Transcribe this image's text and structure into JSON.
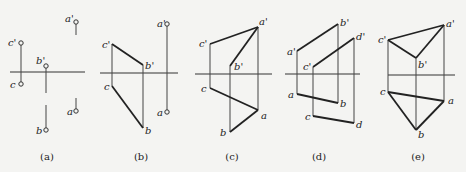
{
  "figure": {
    "panels": [
      {
        "id": "a",
        "caption": "(a)",
        "axis": {
          "x1": 10,
          "x2": 85,
          "y": 72
        },
        "points": [
          {
            "name": "a'",
            "x": 76,
            "y": 22,
            "lx": 65,
            "ly": 22
          },
          {
            "name": "c'",
            "x": 21,
            "y": 43,
            "lx": 8,
            "ly": 46
          },
          {
            "name": "b'",
            "x": 46,
            "y": 66,
            "lx": 36,
            "ly": 64
          },
          {
            "name": "c",
            "x": 21,
            "y": 84,
            "lx": 10,
            "ly": 88
          },
          {
            "name": "a",
            "x": 76,
            "y": 111,
            "lx": 67,
            "ly": 115
          },
          {
            "name": "b",
            "x": 46,
            "y": 130,
            "lx": 36,
            "ly": 134
          }
        ],
        "thin_lines": [
          [
            76,
            22,
            76,
            35
          ],
          [
            21,
            43,
            21,
            84
          ],
          [
            46,
            66,
            46,
            93
          ],
          [
            46,
            105,
            46,
            130
          ],
          [
            76,
            98,
            76,
            111
          ]
        ],
        "thick_lines": [],
        "circles": [
          "a'",
          "c'",
          "b'",
          "c",
          "a",
          "b"
        ]
      },
      {
        "id": "b",
        "caption": "(b)",
        "axis": {
          "x1": 100,
          "x2": 178,
          "y": 73
        },
        "points": [
          {
            "name": "a'",
            "x": 167,
            "y": 24,
            "lx": 157,
            "ly": 27
          },
          {
            "name": "c'",
            "x": 112,
            "y": 44,
            "lx": 102,
            "ly": 48
          },
          {
            "name": "b'",
            "x": 143,
            "y": 65,
            "lx": 145,
            "ly": 69
          },
          {
            "name": "c",
            "x": 112,
            "y": 86,
            "lx": 104,
            "ly": 90
          },
          {
            "name": "a",
            "x": 167,
            "y": 112,
            "lx": 157,
            "ly": 116
          },
          {
            "name": "b",
            "x": 143,
            "y": 128,
            "lx": 145,
            "ly": 134
          }
        ],
        "thin_lines": [
          [
            112,
            44,
            112,
            86
          ],
          [
            143,
            65,
            143,
            128
          ],
          [
            167,
            24,
            167,
            112
          ]
        ],
        "thick_lines": [
          [
            112,
            44,
            143,
            65
          ],
          [
            112,
            86,
            143,
            128
          ]
        ],
        "circles": [
          "a'",
          "a"
        ]
      },
      {
        "id": "c",
        "caption": "(c)",
        "axis": {
          "x1": 195,
          "x2": 272,
          "y": 74
        },
        "points": [
          {
            "name": "a'",
            "x": 258,
            "y": 27,
            "lx": 259,
            "ly": 25
          },
          {
            "name": "c'",
            "x": 210,
            "y": 44,
            "lx": 199,
            "ly": 47
          },
          {
            "name": "b'",
            "x": 230,
            "y": 66,
            "lx": 234,
            "ly": 70
          },
          {
            "name": "c",
            "x": 210,
            "y": 88,
            "lx": 201,
            "ly": 92
          },
          {
            "name": "a",
            "x": 258,
            "y": 110,
            "lx": 261,
            "ly": 119
          },
          {
            "name": "b",
            "x": 230,
            "y": 132,
            "lx": 220,
            "ly": 136
          }
        ],
        "thin_lines": [
          [
            210,
            44,
            210,
            88
          ],
          [
            230,
            66,
            230,
            132
          ],
          [
            258,
            27,
            258,
            110
          ]
        ],
        "thick_lines": [
          [
            210,
            44,
            258,
            27
          ],
          [
            230,
            66,
            258,
            27
          ],
          [
            210,
            88,
            258,
            110
          ],
          [
            230,
            132,
            258,
            110
          ]
        ],
        "circles": []
      },
      {
        "id": "d",
        "caption": "(d)",
        "axis": {
          "x1": 285,
          "x2": 360,
          "y": 74
        },
        "points": [
          {
            "name": "a'",
            "x": 297,
            "y": 51,
            "lx": 287,
            "ly": 55
          },
          {
            "name": "b'",
            "x": 338,
            "y": 24,
            "lx": 340,
            "ly": 26
          },
          {
            "name": "d'",
            "x": 354,
            "y": 38,
            "lx": 356,
            "ly": 40
          },
          {
            "name": "c'",
            "x": 313,
            "y": 67,
            "lx": 303,
            "ly": 70
          },
          {
            "name": "a",
            "x": 297,
            "y": 94,
            "lx": 288,
            "ly": 98
          },
          {
            "name": "b",
            "x": 338,
            "y": 103,
            "lx": 340,
            "ly": 107
          },
          {
            "name": "c",
            "x": 313,
            "y": 116,
            "lx": 305,
            "ly": 120
          },
          {
            "name": "d",
            "x": 354,
            "y": 123,
            "lx": 356,
            "ly": 128
          }
        ],
        "thin_lines": [
          [
            297,
            51,
            297,
            94
          ],
          [
            338,
            24,
            338,
            103
          ],
          [
            313,
            67,
            313,
            116
          ],
          [
            354,
            38,
            354,
            123
          ]
        ],
        "thick_lines": [
          [
            297,
            51,
            338,
            24
          ],
          [
            313,
            67,
            354,
            38
          ],
          [
            297,
            94,
            338,
            103
          ],
          [
            313,
            116,
            354,
            123
          ]
        ],
        "circles": []
      },
      {
        "id": "e",
        "caption": "(e)",
        "axis": {
          "x1": 388,
          "x2": 455,
          "y": 75
        },
        "points": [
          {
            "name": "a'",
            "x": 444,
            "y": 25,
            "lx": 446,
            "ly": 27
          },
          {
            "name": "c'",
            "x": 388,
            "y": 40,
            "lx": 378,
            "ly": 43
          },
          {
            "name": "b'",
            "x": 416,
            "y": 58,
            "lx": 418,
            "ly": 68
          },
          {
            "name": "c",
            "x": 388,
            "y": 92,
            "lx": 380,
            "ly": 95
          },
          {
            "name": "a",
            "x": 444,
            "y": 101,
            "lx": 448,
            "ly": 104
          },
          {
            "name": "b",
            "x": 416,
            "y": 130,
            "lx": 418,
            "ly": 138
          }
        ],
        "thin_lines": [
          [
            388,
            40,
            388,
            92
          ],
          [
            416,
            58,
            416,
            130
          ],
          [
            444,
            25,
            444,
            101
          ]
        ],
        "thick_lines": [
          [
            388,
            40,
            444,
            25
          ],
          [
            388,
            40,
            416,
            58
          ],
          [
            416,
            58,
            444,
            25
          ],
          [
            388,
            92,
            444,
            101
          ],
          [
            388,
            92,
            416,
            130
          ],
          [
            416,
            130,
            444,
            101
          ]
        ],
        "circles": []
      }
    ],
    "caption_y": 160,
    "caption_x": [
      47,
      141,
      232,
      319,
      418
    ]
  }
}
